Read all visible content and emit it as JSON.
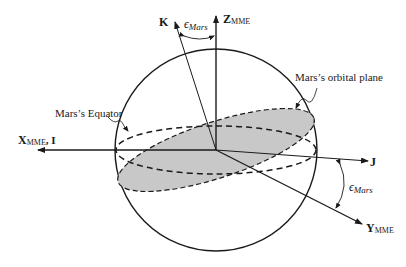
{
  "diagram": {
    "labels": {
      "k_axis": "K",
      "z_axis_main": "Z",
      "z_axis_sub": "MME",
      "x_axis_main": "X",
      "x_axis_sub": "MME",
      "x_axis_suffix": ", I",
      "y_axis_main": "Y",
      "y_axis_sub": "MME",
      "j_axis": "J",
      "epsilon_top": "ϵ",
      "epsilon_top_sub": "Mars",
      "epsilon_right": "ϵ",
      "epsilon_right_sub": "Mars",
      "orbital_plane": "Mars’s orbital plane",
      "equator": "Mars’s Equator"
    },
    "colors": {
      "line": "#1a1a1a",
      "plane_fill": "#c8c8c8",
      "background": "#ffffff"
    }
  }
}
